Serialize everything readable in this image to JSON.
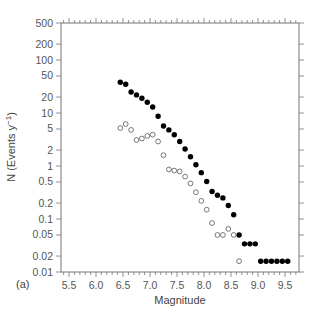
{
  "chart_data": {
    "type": "scatter",
    "title": "",
    "panel_label": "(a)",
    "xlabel": "Magnitude",
    "ylabel": "N (Events y⁻¹)",
    "xlim": [
      5.3,
      9.7
    ],
    "ylim": [
      0.01,
      500
    ],
    "yscale": "log",
    "grid": false,
    "legend": null,
    "x_ticks": [
      5.5,
      6.0,
      6.5,
      7.0,
      7.5,
      8.0,
      8.5,
      9.0,
      9.5
    ],
    "x_tick_labels": [
      "5.5",
      "6.0",
      "6.5",
      "7.0",
      "7.5",
      "8.0",
      "8.5",
      "9.0",
      "9.5"
    ],
    "y_ticks": [
      0.01,
      0.02,
      0.05,
      0.1,
      0.2,
      0.5,
      1,
      2,
      5,
      10,
      20,
      50,
      100,
      200,
      500
    ],
    "y_tick_labels": [
      "0.01",
      "0.02",
      "0.05",
      "0.1",
      "0.2",
      "0.5",
      "1",
      "2",
      "5",
      "10",
      "20",
      "50",
      "100",
      "200",
      "500"
    ],
    "series": [
      {
        "name": "filled",
        "marker": "filled-circle",
        "color": "#000000",
        "x": [
          6.45,
          6.55,
          6.65,
          6.75,
          6.85,
          6.95,
          7.05,
          7.15,
          7.25,
          7.35,
          7.45,
          7.55,
          7.65,
          7.75,
          7.85,
          7.95,
          8.05,
          8.15,
          8.25,
          8.35,
          8.45,
          8.55,
          8.65,
          8.75,
          8.85,
          8.95,
          9.05,
          9.15,
          9.25,
          9.35,
          9.45,
          9.55
        ],
        "y": [
          38,
          35,
          25,
          22,
          19,
          16,
          13,
          8.7,
          5.7,
          4.8,
          3.9,
          2.9,
          2.1,
          1.5,
          1.06,
          0.75,
          0.51,
          0.33,
          0.28,
          0.25,
          0.18,
          0.12,
          0.05,
          0.034,
          0.034,
          0.034,
          0.016,
          0.016,
          0.016,
          0.016,
          0.016,
          0.016
        ]
      },
      {
        "name": "open",
        "marker": "open-circle",
        "color": "#000000",
        "x": [
          6.45,
          6.55,
          6.65,
          6.75,
          6.85,
          6.95,
          7.05,
          7.15,
          7.25,
          7.35,
          7.45,
          7.55,
          7.65,
          7.75,
          7.85,
          7.95,
          8.05,
          8.15,
          8.25,
          8.35,
          8.45,
          8.55,
          8.65
        ],
        "y": [
          5.2,
          6.2,
          4.8,
          3.1,
          3.3,
          3.7,
          3.9,
          2.9,
          1.6,
          0.86,
          0.82,
          0.79,
          0.63,
          0.47,
          0.32,
          0.22,
          0.15,
          0.084,
          0.05,
          0.05,
          0.065,
          0.05,
          0.016
        ]
      }
    ]
  }
}
